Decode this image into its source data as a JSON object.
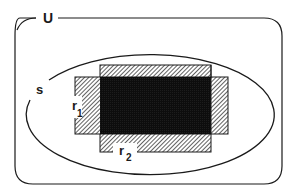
{
  "diagram": {
    "universe_label": "U",
    "set_label": "s",
    "rect1_label": "r",
    "rect1_subscript": "1",
    "rect2_label": "r",
    "rect2_subscript": "2"
  },
  "colors": {
    "background": "#ffffff",
    "stroke": "#1a1a1a",
    "intersection_fill": "#0d0d0d",
    "hatch_line": "#3a3a3a"
  }
}
